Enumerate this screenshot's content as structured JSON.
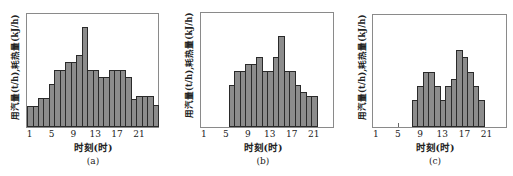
{
  "chart_data": [
    {
      "type": "bar",
      "title": "(a)",
      "xlabel": "时刻(时)",
      "ylabel": "用汽量(t/h),耗热量(kJ/h)",
      "x_ticks": [
        "1",
        "5",
        "9",
        "13",
        "17",
        "21"
      ],
      "categories": [
        1,
        2,
        3,
        4,
        5,
        6,
        7,
        8,
        9,
        10,
        11,
        12,
        13,
        14,
        15,
        16,
        17,
        18,
        19,
        20,
        21,
        22,
        23,
        24
      ],
      "values": [
        21,
        21,
        29,
        29,
        43,
        57,
        57,
        65,
        65,
        72,
        100,
        57,
        57,
        50,
        50,
        57,
        57,
        57,
        50,
        28,
        31,
        31,
        31,
        22
      ],
      "ylim": [
        0,
        113
      ],
      "grid": false
    },
    {
      "type": "bar",
      "title": "(b)",
      "xlabel": "时刻(时)",
      "ylabel": "用汽量(t/h),耗热量(kJ/h)",
      "x_ticks": [
        "1",
        "5",
        "9",
        "13",
        "17",
        "21"
      ],
      "categories": [
        6,
        7,
        8,
        9,
        10,
        11,
        12,
        13,
        14,
        15,
        16,
        17,
        18,
        19,
        20,
        21
      ],
      "values": [
        42,
        57,
        57,
        64,
        64,
        71,
        57,
        57,
        71,
        92,
        57,
        57,
        42,
        35,
        31,
        31
      ],
      "ylim": [
        0,
        115
      ],
      "grid": false
    },
    {
      "type": "bar",
      "title": "(c)",
      "xlabel": "时刻(时)",
      "ylabel": "用汽量(t/h),耗热量(kJ/h)",
      "x_ticks": [
        "1",
        "5",
        "9",
        "13",
        "17",
        "21"
      ],
      "categories": [
        8,
        9,
        10,
        11,
        12,
        13,
        14,
        15,
        16,
        17,
        18,
        19,
        20
      ],
      "values": [
        28,
        42,
        56,
        56,
        42,
        28,
        42,
        49,
        78,
        71,
        56,
        42,
        28
      ],
      "ylim": [
        0,
        114
      ],
      "grid": false
    }
  ],
  "panels": [
    {
      "caption": "(a)",
      "xlabel": "时刻(时)",
      "ylabel": "用汽量(t/h),耗热量(kJ/h)"
    },
    {
      "caption": "(b)",
      "xlabel": "时刻(时)",
      "ylabel": "用汽量(t/h),耗热量(kJ/h)"
    },
    {
      "caption": "(c)",
      "xlabel": "时刻(时)",
      "ylabel": "用汽量(t/h),耗热量(kJ/h)"
    }
  ],
  "colors": {
    "bar_fill": "#8c8c8c",
    "bar_edge": "#2a2a2a",
    "frame": "#8a8a8a"
  }
}
